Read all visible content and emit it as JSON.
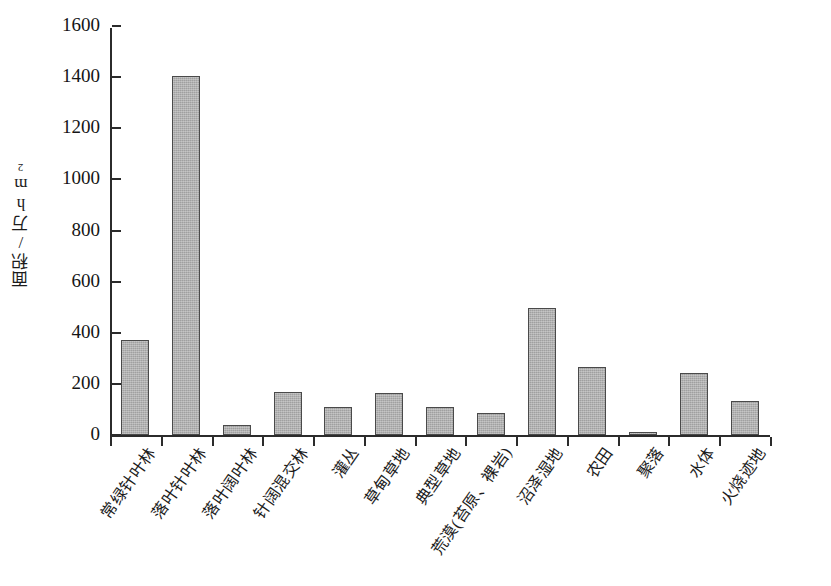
{
  "chart_data": {
    "type": "bar",
    "title": "",
    "subtitle": "",
    "xlabel": "",
    "ylabel": "面积/万hm2",
    "ylabel_main": "面积/万hm",
    "ylabel_sup": "2",
    "ylim": [
      0,
      1600
    ],
    "ytick_values": [
      0,
      200,
      400,
      600,
      800,
      1000,
      1200,
      1400,
      1600
    ],
    "ytick_labels": [
      "0",
      "200",
      "400",
      "600",
      "800",
      "1000",
      "1200",
      "1400",
      "1600"
    ],
    "grid": false,
    "legend": null,
    "bar_color": "#ababab",
    "bar_edge_color": "#4a4a4a",
    "axis_color": "#2b2b2b",
    "categories": [
      "常绿针叶林",
      "落叶针叶林",
      "落叶阔叶林",
      "针阔混交林",
      "灌丛",
      "草甸草地",
      "典型草地",
      "荒漠(苔原、裸岩)",
      "沼泽湿地",
      "农田",
      "聚落",
      "水体",
      "火烧迹地"
    ],
    "values": [
      370,
      1405,
      40,
      170,
      108,
      163,
      110,
      85,
      497,
      268,
      10,
      243,
      132
    ]
  }
}
